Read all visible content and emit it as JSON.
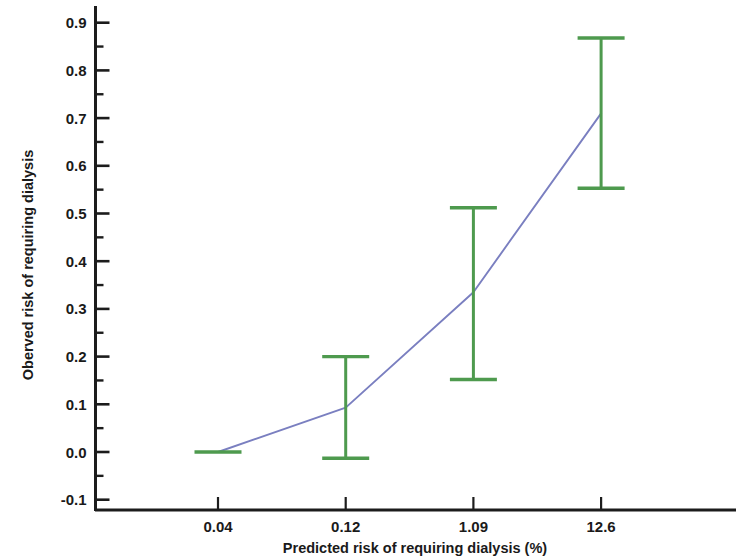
{
  "figure": {
    "background_color": "#ffffff",
    "width": 738,
    "height": 560
  },
  "chart_data": {
    "type": "line",
    "title": "",
    "subtitle": "",
    "xlabel": "Predicted risk of requiring dialysis (%)",
    "ylabel": "Oberved risk of requiring dialysis",
    "categories": [
      "0.04",
      "0.12",
      "1.09",
      "12.6"
    ],
    "x_tick_labels": [
      "0.04",
      "0.12",
      "1.09",
      "12.6"
    ],
    "y_tick_labels": [
      "-0.1",
      "0.0",
      "0.1",
      "0.2",
      "0.3",
      "0.4",
      "0.5",
      "0.6",
      "0.7",
      "0.8",
      "0.9"
    ],
    "y_tick_values": [
      -0.1,
      0.0,
      0.1,
      0.2,
      0.3,
      0.4,
      0.5,
      0.6,
      0.7,
      0.8,
      0.9
    ],
    "ylim": [
      -0.13,
      0.94
    ],
    "y_minor_tick_step": 0.05,
    "grid": false,
    "legend": null,
    "legend_position": "none",
    "series": [
      {
        "name": "Observed risk",
        "type": "line-with-errorbars",
        "line_color": "#7a7fc0",
        "errorbar_color": "#4e9a4e",
        "values": [
          0.0,
          0.093,
          0.335,
          0.71
        ],
        "error_upper": [
          0.0,
          0.2,
          0.512,
          0.868
        ],
        "error_lower": [
          0.0,
          -0.013,
          0.152,
          0.553
        ],
        "points": [
          {
            "category": "0.04",
            "value": 0.0,
            "ci_low": 0.0,
            "ci_high": 0.0
          },
          {
            "category": "0.12",
            "value": 0.093,
            "ci_low": -0.013,
            "ci_high": 0.2
          },
          {
            "category": "1.09",
            "value": 0.335,
            "ci_low": 0.152,
            "ci_high": 0.512
          },
          {
            "category": "12.6",
            "value": 0.71,
            "ci_low": 0.553,
            "ci_high": 0.868
          }
        ]
      }
    ],
    "colors": {
      "line": "#7a7fc0",
      "errorbar": "#4e9a4e",
      "axis": "#1c1c1c",
      "text": "#1a1a1a"
    }
  }
}
